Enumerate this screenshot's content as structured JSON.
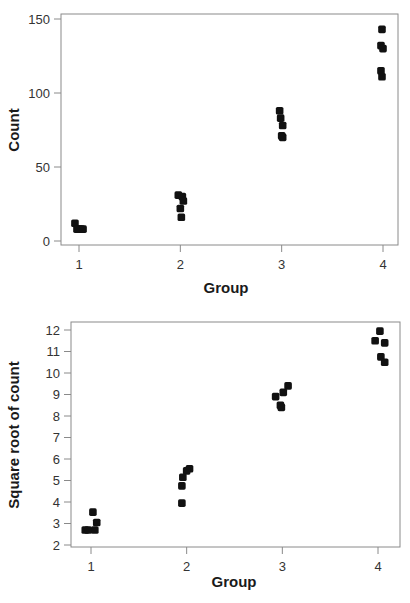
{
  "chart_data": [
    {
      "type": "scatter",
      "title": "",
      "xlabel": "Group",
      "ylabel": "Count",
      "x_ticks": [
        1,
        2,
        3,
        4
      ],
      "y_ticks": [
        0,
        50,
        100,
        150
      ],
      "ylim": [
        0,
        150
      ],
      "xlim": [
        0.8,
        4.15
      ],
      "grid": false,
      "legend": null,
      "series": [
        {
          "name": "Group 1",
          "x": [
            0.96,
            1.0,
            1.02,
            0.98,
            1.04
          ],
          "y": [
            12,
            8,
            8,
            8,
            8
          ]
        },
        {
          "name": "Group 2",
          "x": [
            1.98,
            2.02,
            2.03,
            2.0,
            2.01
          ],
          "y": [
            31,
            30,
            27,
            22,
            16
          ]
        },
        {
          "name": "Group 3",
          "x": [
            2.98,
            2.99,
            3.01,
            3.0,
            3.01
          ],
          "y": [
            88,
            83,
            78,
            71,
            70
          ]
        },
        {
          "name": "Group 4",
          "x": [
            3.99,
            3.98,
            4.0,
            3.98,
            3.99
          ],
          "y": [
            143,
            132,
            130,
            115,
            111
          ]
        }
      ]
    },
    {
      "type": "scatter",
      "title": "",
      "xlabel": "Group",
      "ylabel": "Square root of count",
      "x_ticks": [
        1,
        2,
        3,
        4
      ],
      "y_ticks": [
        2,
        3,
        4,
        5,
        6,
        7,
        8,
        9,
        10,
        11,
        12
      ],
      "ylim": [
        2,
        12
      ],
      "xlim": [
        0.8,
        4.2
      ],
      "grid": false,
      "legend": null,
      "series": [
        {
          "name": "Group 1",
          "x": [
            1.02,
            1.06,
            0.94,
            0.97,
            1.04
          ],
          "y": [
            3.53,
            3.05,
            2.7,
            2.7,
            2.7
          ]
        },
        {
          "name": "Group 2",
          "x": [
            2.03,
            2.0,
            1.96,
            1.95,
            1.95
          ],
          "y": [
            5.55,
            5.45,
            5.15,
            4.75,
            3.95
          ]
        },
        {
          "name": "Group 3",
          "x": [
            3.06,
            3.01,
            2.93,
            2.98,
            2.99
          ],
          "y": [
            9.4,
            9.1,
            8.9,
            8.5,
            8.4
          ]
        },
        {
          "name": "Group 4",
          "x": [
            4.02,
            3.97,
            4.07,
            4.03,
            4.07
          ],
          "y": [
            11.95,
            11.5,
            11.4,
            10.75,
            10.5
          ]
        }
      ]
    }
  ]
}
